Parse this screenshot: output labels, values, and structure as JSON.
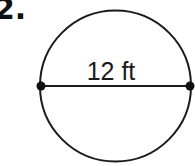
{
  "problem": {
    "number_label": "2."
  },
  "figure": {
    "shape": "circle",
    "segment": "diameter",
    "measurement_label": "12 ft",
    "center": [
      115.5,
      86
    ],
    "radius": 75.5,
    "endpoints": [
      [
        41,
        86
      ],
      [
        190,
        86
      ]
    ],
    "stroke_color": "#1a1a1a"
  }
}
